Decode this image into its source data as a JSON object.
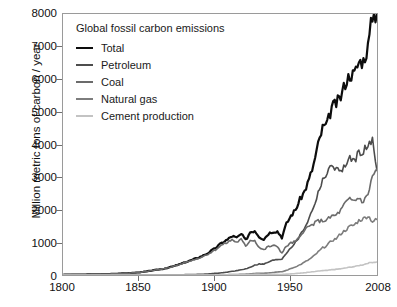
{
  "chart_data": {
    "type": "line",
    "title": "Global fossil carbon emissions",
    "xlabel": "",
    "ylabel": "Million metric tons of carbon / year",
    "xlim": [
      1800,
      2008
    ],
    "ylim": [
      0,
      8000
    ],
    "grid": false,
    "legend_position": "top-left",
    "xticks": [
      "1800",
      "1850",
      "1900",
      "1950",
      "2008"
    ],
    "xtick_values": [
      1800,
      1850,
      1900,
      1950,
      2008
    ],
    "yticks": [
      "0",
      "1000",
      "2000",
      "3000",
      "4000",
      "5000",
      "6000",
      "7000",
      "8000"
    ],
    "ytick_values": [
      0,
      1000,
      2000,
      3000,
      4000,
      5000,
      6000,
      7000,
      8000
    ],
    "x": [
      1800,
      1805,
      1810,
      1815,
      1820,
      1825,
      1830,
      1835,
      1840,
      1845,
      1850,
      1855,
      1860,
      1865,
      1870,
      1875,
      1880,
      1885,
      1890,
      1895,
      1900,
      1903,
      1906,
      1909,
      1912,
      1915,
      1918,
      1921,
      1924,
      1927,
      1930,
      1933,
      1936,
      1939,
      1942,
      1945,
      1948,
      1951,
      1954,
      1957,
      1960,
      1963,
      1966,
      1969,
      1972,
      1975,
      1978,
      1981,
      1984,
      1987,
      1990,
      1993,
      1996,
      1999,
      2002,
      2005,
      2008
    ],
    "series": [
      {
        "name": "Total",
        "color": "#0d0d0d",
        "width": 2.2,
        "values": [
          8,
          10,
          12,
          15,
          19,
          24,
          30,
          38,
          48,
          62,
          79,
          106,
          147,
          176,
          228,
          295,
          376,
          455,
          540,
          645,
          792,
          905,
          1012,
          1086,
          1197,
          1135,
          1253,
          1068,
          1319,
          1364,
          1182,
          1096,
          1269,
          1338,
          1340,
          1158,
          1568,
          1817,
          1997,
          2316,
          2569,
          2923,
          3382,
          3992,
          4508,
          4617,
          5144,
          5256,
          5462,
          5888,
          6145,
          6162,
          6528,
          6571,
          6989,
          7973,
          8005
        ]
      },
      {
        "name": "Petroleum",
        "color": "#4d4d4d",
        "width": 1.6,
        "values": [
          0,
          0,
          0,
          0,
          0,
          0,
          0,
          0,
          0,
          0,
          0,
          0,
          1,
          2,
          3,
          5,
          9,
          13,
          20,
          28,
          47,
          57,
          73,
          89,
          114,
          133,
          161,
          186,
          240,
          300,
          336,
          330,
          397,
          446,
          475,
          491,
          677,
          844,
          990,
          1205,
          1451,
          1729,
          2094,
          2502,
          2954,
          3035,
          3442,
          3203,
          3203,
          3335,
          3544,
          3514,
          3725,
          3829,
          3908,
          4118,
          3200
        ]
      },
      {
        "name": "Coal",
        "color": "#6b6b6b",
        "width": 1.6,
        "values": [
          8,
          10,
          12,
          15,
          19,
          24,
          30,
          38,
          48,
          62,
          79,
          106,
          146,
          174,
          225,
          290,
          367,
          442,
          520,
          617,
          745,
          848,
          939,
          997,
          1083,
          1002,
          1092,
          876,
          1070,
          1059,
          843,
          764,
          872,
          893,
          880,
          668,
          884,
          979,
          1029,
          1158,
          1410,
          1478,
          1563,
          1659,
          1661,
          1694,
          1802,
          1835,
          1982,
          2201,
          2314,
          2277,
          2367,
          2233,
          2482,
          3022,
          3250
        ]
      },
      {
        "name": "Natural gas",
        "color": "#7d7d7d",
        "width": 1.6,
        "values": [
          0,
          0,
          0,
          0,
          0,
          0,
          0,
          0,
          0,
          0,
          0,
          0,
          0,
          0,
          0,
          0,
          0,
          1,
          2,
          3,
          4,
          5,
          7,
          9,
          12,
          15,
          20,
          26,
          36,
          47,
          56,
          53,
          63,
          76,
          93,
          98,
          141,
          197,
          250,
          314,
          393,
          473,
          575,
          703,
          833,
          910,
          1053,
          1114,
          1267,
          1372,
          1484,
          1534,
          1669,
          1724,
          1817,
          1644,
          1700
        ]
      },
      {
        "name": "Cement production",
        "color": "#c3c3c3",
        "width": 1.6,
        "values": [
          0,
          0,
          0,
          0,
          0,
          0,
          0,
          0,
          0,
          0,
          0,
          0,
          0,
          0,
          0,
          0,
          0,
          0,
          0,
          1,
          2,
          3,
          4,
          5,
          7,
          6,
          7,
          9,
          14,
          18,
          19,
          14,
          19,
          24,
          19,
          14,
          26,
          35,
          45,
          57,
          70,
          85,
          100,
          118,
          133,
          140,
          162,
          174,
          190,
          213,
          240,
          257,
          289,
          317,
          364,
          391,
          400
        ]
      }
    ]
  },
  "legend": {
    "title": "Global fossil carbon emissions",
    "items": [
      {
        "label": "Total",
        "color": "#0d0d0d",
        "thickness": "2.6px"
      },
      {
        "label": "Petroleum",
        "color": "#4d4d4d",
        "thickness": "2.1px"
      },
      {
        "label": "Coal",
        "color": "#6b6b6b",
        "thickness": "2.1px"
      },
      {
        "label": "Natural gas",
        "color": "#7d7d7d",
        "thickness": "2.1px"
      },
      {
        "label": "Cement production",
        "color": "#c3c3c3",
        "thickness": "2.1px"
      }
    ]
  },
  "axes": {
    "y_title": "Million metric tons of carbon / year",
    "frame_color": "#9a9a9a",
    "tick_color": "#6f6f6f",
    "text_color": "#111111"
  }
}
